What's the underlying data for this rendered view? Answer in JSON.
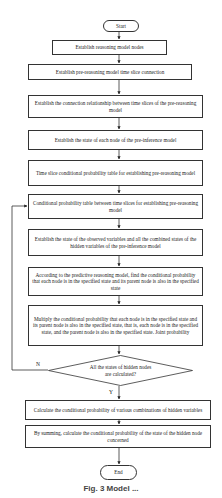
{
  "flowchart": {
    "start": "Start",
    "end": "End",
    "steps": [
      "Establish reasoning model nodes",
      "Establish pre-reasoning model time slice connection",
      "Establish the connection relationship between time slices of the pre-reasoning model",
      "Establish the state of each node of the pre-inference model",
      "Time slice conditional probability table for establishing pre-reasoning model",
      "Conditional probability table between time slices for establishing pre-reasoning model",
      "Establish the state of the observed variables and all the combined states of the hidden variables of the pre-inference model",
      "According to the predictive reasoning model, find the conditional probability that each node is in the specified state and its parent node is also in the specified state",
      "Multiply the conditional probability that each node is in the specified state and its parent node is also in the specified state, that is, each node is in the specified state, and the parent node is also in the specified state. Joint probability"
    ],
    "decision": "All the states of hidden nodes are calculated?",
    "decision_no_label": "N",
    "decision_yes_label": "Y",
    "after_steps": [
      "Calculate the conditional probability of various combinations of hidden variables",
      "By summing, calculate the conditional probability of the state of the hidden node concerned"
    ]
  },
  "caption": "Fig. 3  Model ..."
}
